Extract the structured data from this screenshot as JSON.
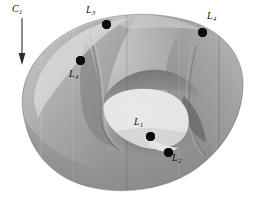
{
  "figure": {
    "background_color": "#ffffff",
    "surface_colors": {
      "highlight": "#e8e8e8",
      "light": "#c9c9c9",
      "mid": "#9a9a9a",
      "dark": "#6f6f6f",
      "darkest": "#4a4a4a",
      "hole": "#fdfdfd",
      "outline": "#3a3a3a"
    },
    "point_color": "#0b0b0b"
  },
  "curve_annotation": {
    "name": "curve-label-c1",
    "letter": "C",
    "subscript": "1",
    "arrow_direction": "down",
    "x": 12,
    "y": 4
  },
  "points": [
    {
      "id": "L1",
      "letter": "L",
      "subscript": "1",
      "dot_x": 150,
      "dot_y": 136,
      "label_x": 134,
      "label_y": 117
    },
    {
      "id": "L2",
      "letter": "L",
      "subscript": "2",
      "dot_x": 168,
      "dot_y": 152,
      "label_x": 172,
      "label_y": 153
    },
    {
      "id": "L3",
      "letter": "L",
      "subscript": "3",
      "dot_x": 106,
      "dot_y": 24,
      "label_x": 86,
      "label_y": 5
    },
    {
      "id": "L4",
      "letter": "L",
      "subscript": "4",
      "dot_x": 202,
      "dot_y": 32,
      "label_x": 207,
      "label_y": 11
    },
    {
      "id": "L4b",
      "letter": "L",
      "subscript": "4",
      "dot_x": 80,
      "dot_y": 60,
      "label_x": 69,
      "label_y": 69
    }
  ]
}
